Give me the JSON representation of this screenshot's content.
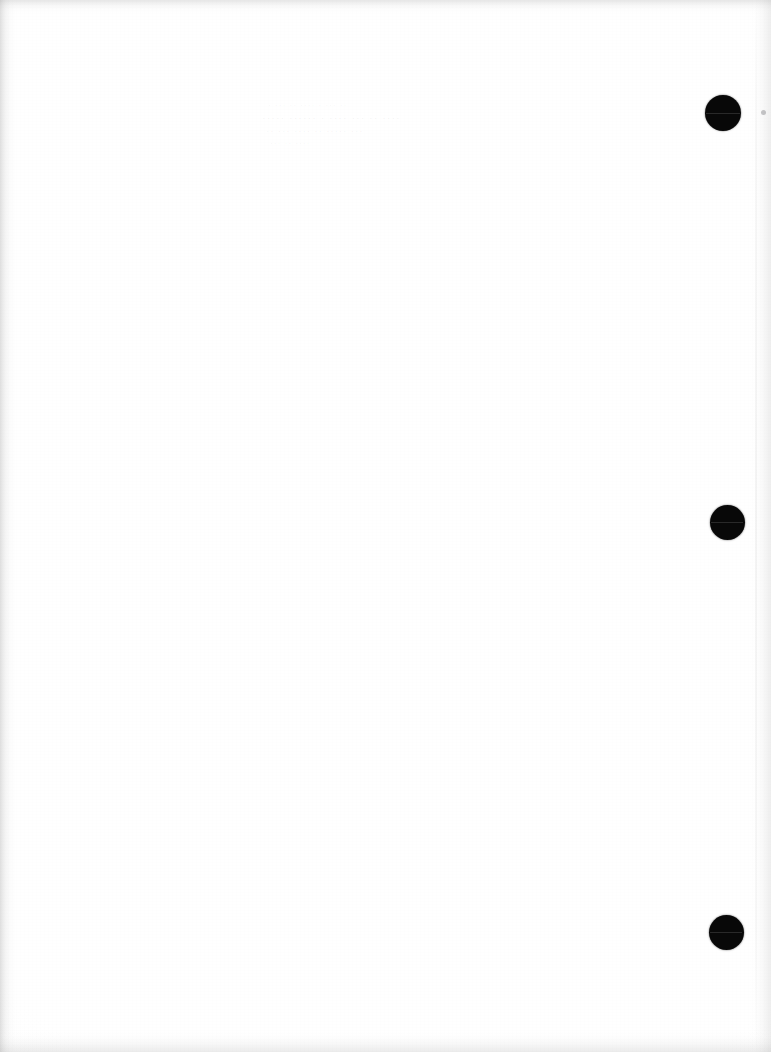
{
  "document": {
    "page_type": "scanned-blank-page",
    "page_background_color": "#fefefe",
    "ink_color": "#080808",
    "width": 771,
    "height": 1052
  },
  "punch_holes": {
    "label": "binding-hole",
    "color": "#080808",
    "items": [
      {
        "name": "binding-hole-top",
        "cx": 723,
        "cy": 113,
        "d": 36
      },
      {
        "name": "binding-hole-middle",
        "cx": 727,
        "cy": 522,
        "d": 35
      },
      {
        "name": "binding-hole-bottom",
        "cx": 726,
        "cy": 932,
        "d": 35
      }
    ]
  },
  "ghost_text": {
    "note": "bleed-through from reverse side; illegible",
    "color": "#78787d",
    "lines": [
      {
        "text": "· ··· ··  ···· · ···  ··",
        "x": 268,
        "y": 100,
        "size": 9
      },
      {
        "text": "····· ······ · ···· ··· ·· ····",
        "x": 262,
        "y": 112,
        "size": 11
      },
      {
        "text": "·· ··· ···· ··  ····· ···",
        "x": 266,
        "y": 126,
        "size": 10
      },
      {
        "text": "··· ··  ····",
        "x": 270,
        "y": 138,
        "size": 9
      }
    ]
  },
  "scan_artifacts": {
    "speck": {
      "name": "scan-speck",
      "cx": 763,
      "cy": 112,
      "d": 5
    },
    "page_edge_line_x": 755,
    "edges": {
      "left_shadow_width": 16,
      "top_shadow_height": 14,
      "bottom_shadow_height": 22,
      "right_shadow_width": 22
    }
  }
}
